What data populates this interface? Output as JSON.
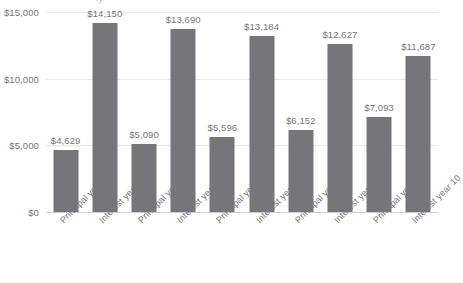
{
  "artifact": {
    "top_clipped_text": "ly"
  },
  "chart_data": {
    "type": "bar",
    "title": "",
    "subtitle": "",
    "xlabel": "",
    "ylabel": "",
    "ylim": [
      0,
      15000
    ],
    "grid": true,
    "legend": "none",
    "orientation": "vertical",
    "bar_color": "#76767a",
    "gridline_color": "#e9e9ea",
    "axis_color": "#cfcfd1",
    "label_color": "#76767a",
    "background": "#ffffff",
    "ytick_labels": [
      "$0",
      "$5,000",
      "$10,000",
      "$15,000"
    ],
    "ytick_values": [
      0,
      5000,
      10000,
      15000
    ],
    "categories": [
      "Principal year 1",
      "Interest year 1",
      "Principal year 3",
      "Interest year 3",
      "Principal year 5",
      "Interest year 5",
      "Principal year 7",
      "Interest year 7",
      "Principal year 10",
      "Interest year 10"
    ],
    "values": [
      4629,
      14150,
      5090,
      13690,
      5596,
      13184,
      6152,
      12627,
      7093,
      11687
    ],
    "data_labels": [
      "$4,629",
      "$14,150",
      "$5,090",
      "$13,690",
      "$5,596",
      "$13,184",
      "$6,152",
      "$12,627",
      "$7,093",
      "$11,687"
    ]
  }
}
